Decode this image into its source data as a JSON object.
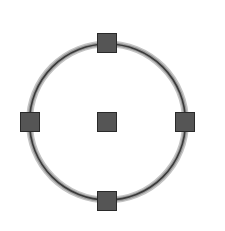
{
  "figure": {
    "circle": {
      "cx": 107.5,
      "cy": 122,
      "r": 78,
      "stroke_color": "#3a3a3a",
      "halo_color": "#b5b5b5"
    },
    "handles": [
      {
        "name": "top",
        "x": 97,
        "y": 33
      },
      {
        "name": "left",
        "x": 20,
        "y": 112
      },
      {
        "name": "center",
        "x": 97,
        "y": 112
      },
      {
        "name": "right",
        "x": 175,
        "y": 112
      },
      {
        "name": "bottom",
        "x": 97,
        "y": 191
      }
    ],
    "handle_fill": "#555555",
    "handle_border": "#2a2a2a"
  }
}
